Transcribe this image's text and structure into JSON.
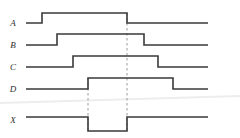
{
  "figure": {
    "kind": "digital-timing-diagram",
    "width": 240,
    "height": 138,
    "background_color": "#ffffff",
    "wave_color": "#3a3a3a",
    "marker_color": "#9a9a9a",
    "label_color": "#2e2e2e",
    "artifact_color": "#ededed"
  },
  "signals": [
    {
      "id": "A",
      "label": "A",
      "label_x": 13,
      "label_y": 26,
      "high_y": 13,
      "low_y": 23,
      "start_x": 26,
      "end_x": 208,
      "initial_level": "low",
      "edges": [
        {
          "x": 42,
          "to": "high"
        },
        {
          "x": 127,
          "to": "low"
        }
      ],
      "path": "M26,23 L42,23 L42,13 L127,13 L127,23 L208,23"
    },
    {
      "id": "B",
      "label": "B",
      "label_x": 13,
      "label_y": 48,
      "high_y": 34,
      "low_y": 45,
      "start_x": 26,
      "end_x": 208,
      "initial_level": "low",
      "edges": [
        {
          "x": 57,
          "to": "high"
        },
        {
          "x": 144,
          "to": "low"
        }
      ],
      "path": "M26,45 L57,45 L57,34 L144,34 L144,45 L208,45"
    },
    {
      "id": "C",
      "label": "C",
      "label_x": 13,
      "label_y": 70,
      "high_y": 56,
      "low_y": 67,
      "start_x": 26,
      "end_x": 208,
      "initial_level": "low",
      "edges": [
        {
          "x": 73,
          "to": "high"
        },
        {
          "x": 158,
          "to": "low"
        }
      ],
      "path": "M26,67 L73,67 L73,56 L158,56 L158,67 L208,67"
    },
    {
      "id": "D",
      "label": "D",
      "label_x": 13,
      "label_y": 92,
      "high_y": 78,
      "low_y": 89,
      "start_x": 26,
      "end_x": 208,
      "initial_level": "low",
      "edges": [
        {
          "x": 88,
          "to": "high"
        },
        {
          "x": 173,
          "to": "low"
        }
      ],
      "path": "M26,89 L88,89 L88,78 L173,78 L173,89 L208,89"
    },
    {
      "id": "X",
      "label": "X",
      "label_x": 13,
      "label_y": 123,
      "high_y": 117,
      "low_y": 131,
      "start_x": 26,
      "end_x": 208,
      "initial_level": "high",
      "edges": [
        {
          "x": 88,
          "to": "low"
        },
        {
          "x": 127,
          "to": "high"
        }
      ],
      "path": "M26,117 L88,117 L88,131 L127,131 L127,117 L208,117"
    }
  ],
  "markers": [
    {
      "id": "marker-left",
      "x": 88,
      "y_top": 78,
      "y_bottom": 131,
      "anchored_to": "D rising edge"
    },
    {
      "id": "marker-right",
      "x": 127,
      "y_top": 13,
      "y_bottom": 131,
      "anchored_to": "A falling edge"
    }
  ],
  "artifacts": [
    {
      "id": "scan-streak",
      "x1": 0,
      "y1": 103,
      "x2": 240,
      "y2": 96
    }
  ]
}
